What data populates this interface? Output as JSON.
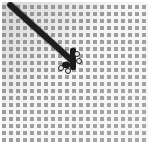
{
  "image": {
    "description": "Grayscale close-up of a square wire mesh grid with a dark rod crossing diagonally from top-left and a small dark object near the center",
    "colors": {
      "background": "#ffffff",
      "mesh_wire": "#f6f6f6",
      "mesh_cell": "#9d9d9d",
      "rod": "#1f1f1f"
    }
  }
}
